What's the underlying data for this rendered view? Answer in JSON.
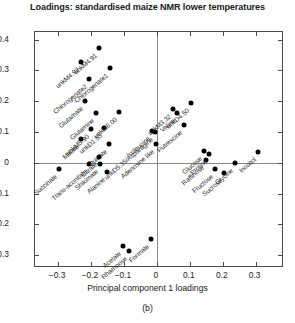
{
  "chart_data": {
    "type": "scatter",
    "title": "Loadings: standardised maize NMR lower temperatures",
    "xlabel": "Principal component 1 loadings",
    "ylabel": "Principal component 2 loadings",
    "caption": "(b)",
    "xlim": [
      -0.37,
      0.38
    ],
    "ylim": [
      -0.335,
      0.425
    ],
    "xticks": [
      -0.3,
      -0.2,
      -0.1,
      0,
      0.1,
      0.2,
      0.3
    ],
    "xticklabels": [
      "−0.3",
      "−0.2",
      "−0.1",
      "0",
      "0.1",
      "0.2",
      "0.3"
    ],
    "yticks": [
      -0.3,
      -0.2,
      -0.1,
      0,
      0.1,
      0.2,
      0.3,
      0.4
    ],
    "yticklabels": [
      "−0.3",
      "−0.2",
      "−0.1",
      "0",
      "0.1",
      "0.2",
      "0.3",
      "0.4"
    ],
    "grid": false,
    "legend": null,
    "marker_color": "#000000",
    "label_rotation_deg": -40,
    "points": [
      {
        "label": "unkM4.92",
        "x": -0.229,
        "y": 0.327
      },
      {
        "label": "unkM4.91",
        "x": -0.176,
        "y": 0.372
      },
      {
        "label": "Chlorogenate2",
        "x": -0.206,
        "y": 0.272
      },
      {
        "label": "Chlorogenate1",
        "x": -0.143,
        "y": 0.307
      },
      {
        "label": "Glutamate",
        "x": -0.218,
        "y": 0.201
      },
      {
        "label": "Glutamine",
        "x": -0.185,
        "y": 0.163
      },
      {
        "label": "unkM5.90",
        "x": -0.2,
        "y": 0.111
      },
      {
        "label": "unkD1.53",
        "x": -0.161,
        "y": 0.113
      },
      {
        "label": "unkM6.00",
        "x": -0.116,
        "y": 0.165
      },
      {
        "label": "Quinate",
        "x": -0.146,
        "y": 0.06
      },
      {
        "label": "Malate",
        "x": -0.229,
        "y": 0.078
      },
      {
        "label": "Succinate",
        "x": -0.296,
        "y": -0.021
      },
      {
        "label": "Trans-aconitate",
        "x": -0.206,
        "y": -0.004
      },
      {
        "label": "Citrate",
        "x": -0.176,
        "y": 0.018
      },
      {
        "label": "Shikimate",
        "x": -0.173,
        "y": -0.004
      },
      {
        "label": "Alanine",
        "x": -0.152,
        "y": -0.031
      },
      {
        "label": "Isoleucine",
        "x": -0.014,
        "y": 0.103
      },
      {
        "label": "unkD5.35/Asparagine",
        "x": -0.007,
        "y": 0.101
      },
      {
        "label": "unkM3.32",
        "x": 0.049,
        "y": 0.176
      },
      {
        "label": "Valine",
        "x": 0.062,
        "y": 0.163
      },
      {
        "label": "Adenosine like",
        "x": -0.003,
        "y": 0.06
      },
      {
        "label": "Putrescine",
        "x": 0.082,
        "y": 0.124
      },
      {
        "label": "unkD4.50",
        "x": 0.105,
        "y": 0.196
      },
      {
        "label": "Glucose",
        "x": 0.142,
        "y": 0.038
      },
      {
        "label": "Raffinose",
        "x": 0.148,
        "y": 0.01
      },
      {
        "label": "Proline",
        "x": 0.158,
        "y": 0.029
      },
      {
        "label": "Fructose",
        "x": 0.176,
        "y": -0.019
      },
      {
        "label": "Sucrose",
        "x": 0.205,
        "y": -0.033
      },
      {
        "label": "Glycine",
        "x": 0.238,
        "y": -0.002
      },
      {
        "label": "Inositol",
        "x": 0.308,
        "y": 0.036
      },
      {
        "label": "Acetate",
        "x": -0.104,
        "y": -0.27
      },
      {
        "label": "Rhamnose",
        "x": -0.084,
        "y": -0.285
      },
      {
        "label": "Formate",
        "x": -0.017,
        "y": -0.246
      }
    ]
  }
}
